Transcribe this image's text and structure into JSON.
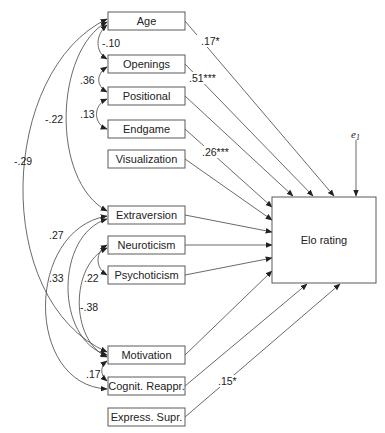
{
  "diagram": {
    "type": "path-diagram",
    "outcome": {
      "label": "Elo rating",
      "x": 272,
      "y": 197,
      "w": 104,
      "h": 86
    },
    "error_term": {
      "label": "e",
      "subscript": "1"
    },
    "predictors": [
      {
        "id": "age",
        "label": "Age",
        "y": 12
      },
      {
        "id": "openings",
        "label": "Openings",
        "y": 55
      },
      {
        "id": "positional",
        "label": "Positional",
        "y": 87
      },
      {
        "id": "endgame",
        "label": "Endgame",
        "y": 120
      },
      {
        "id": "visualization",
        "label": "Visualization",
        "y": 150
      },
      {
        "id": "extraversion",
        "label": "Extraversion",
        "y": 206
      },
      {
        "id": "neuroticism",
        "label": "Neuroticism",
        "y": 236
      },
      {
        "id": "psychoticism",
        "label": "Psychoticism",
        "y": 266
      },
      {
        "id": "motivation",
        "label": "Motivation",
        "y": 346
      },
      {
        "id": "cognit_reappr",
        "label": "Cognit. Reappr.",
        "y": 377
      },
      {
        "id": "express_supr",
        "label": "Express. Supr.",
        "y": 408
      }
    ],
    "path_coefficients": [
      {
        "from": "Age",
        "label": ".17*"
      },
      {
        "from": "Openings",
        "label": ".51***"
      },
      {
        "from": "Endgame",
        "label": ".26***"
      },
      {
        "from": "Express. Supr.",
        "label": ".15*"
      }
    ],
    "correlations": [
      {
        "between": [
          "Age",
          "Openings"
        ],
        "label": "-.10"
      },
      {
        "between": [
          "Openings",
          "Positional"
        ],
        "label": ".36"
      },
      {
        "between": [
          "Positional",
          "Endgame"
        ],
        "label": ".13"
      },
      {
        "between": [
          "Age",
          "Extraversion"
        ],
        "label": "-.22"
      },
      {
        "between": [
          "Age",
          "Motivation"
        ],
        "label": "-.29"
      },
      {
        "between": [
          "Extraversion",
          "Cognit. Reappr."
        ],
        "label": ".27"
      },
      {
        "between": [
          "Extraversion",
          "Motivation"
        ],
        "label": ".33"
      },
      {
        "between": [
          "Neuroticism",
          "Psychoticism"
        ],
        "label": ".22"
      },
      {
        "between": [
          "Neuroticism",
          "Motivation"
        ],
        "label": "-.38"
      },
      {
        "between": [
          "Motivation",
          "Cognit. Reappr."
        ],
        "label": ".17"
      }
    ]
  },
  "labels": {
    "age": "Age",
    "openings": "Openings",
    "positional": "Positional",
    "endgame": "Endgame",
    "visualization": "Visualization",
    "extraversion": "Extraversion",
    "neuroticism": "Neuroticism",
    "psychoticism": "Psychoticism",
    "motivation": "Motivation",
    "cognit_reappr": "Cognit. Reappr.",
    "express_supr": "Express. Supr.",
    "elo": "Elo rating",
    "e": "e",
    "e_sub": "1"
  },
  "coefs": {
    "age_elo": ".17*",
    "openings_elo": ".51***",
    "endgame_elo": ".26***",
    "express_elo": ".15*",
    "age_openings": "-.10",
    "openings_positional": ".36",
    "positional_endgame": ".13",
    "age_extraversion": "-.22",
    "age_motivation": "-.29",
    "extraversion_cognit": ".27",
    "extraversion_motivation": ".33",
    "neuroticism_psychoticism": ".22",
    "neuroticism_motivation": "-.38",
    "motivation_cognit": ".17"
  }
}
